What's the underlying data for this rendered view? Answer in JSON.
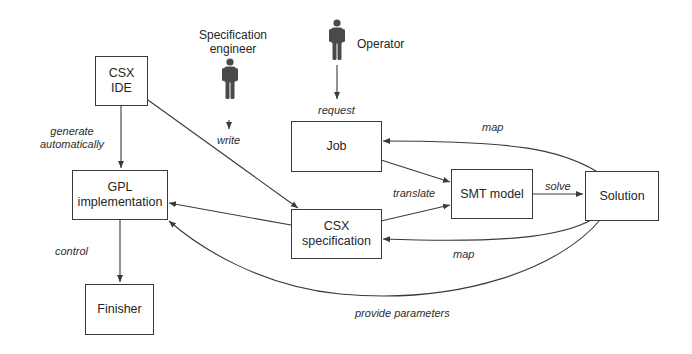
{
  "actors": {
    "spec_engineer": {
      "label_line1": "Specification",
      "label_line2": "engineer"
    },
    "operator": {
      "label": "Operator"
    }
  },
  "nodes": {
    "csx_ide": {
      "line1": "CSX",
      "line2": "IDE"
    },
    "gpl_impl": {
      "line1": "GPL",
      "line2": "implementation"
    },
    "finisher": {
      "label": "Finisher"
    },
    "job": {
      "label": "Job"
    },
    "csx_spec": {
      "line1": "CSX",
      "line2": "specification"
    },
    "smt_model": {
      "label": "SMT model"
    },
    "solution": {
      "label": "Solution"
    }
  },
  "edges": {
    "generate": {
      "line1": "generate",
      "line2": "automatically"
    },
    "control": "control",
    "write": "write",
    "request": "request",
    "translate": "translate",
    "solve": "solve",
    "map_top": "map",
    "map_bottom": "map",
    "provide_parameters": "provide parameters"
  },
  "colors": {
    "line": "#3a3a3a",
    "icon": "#4a4a4a",
    "background": "#ffffff"
  }
}
